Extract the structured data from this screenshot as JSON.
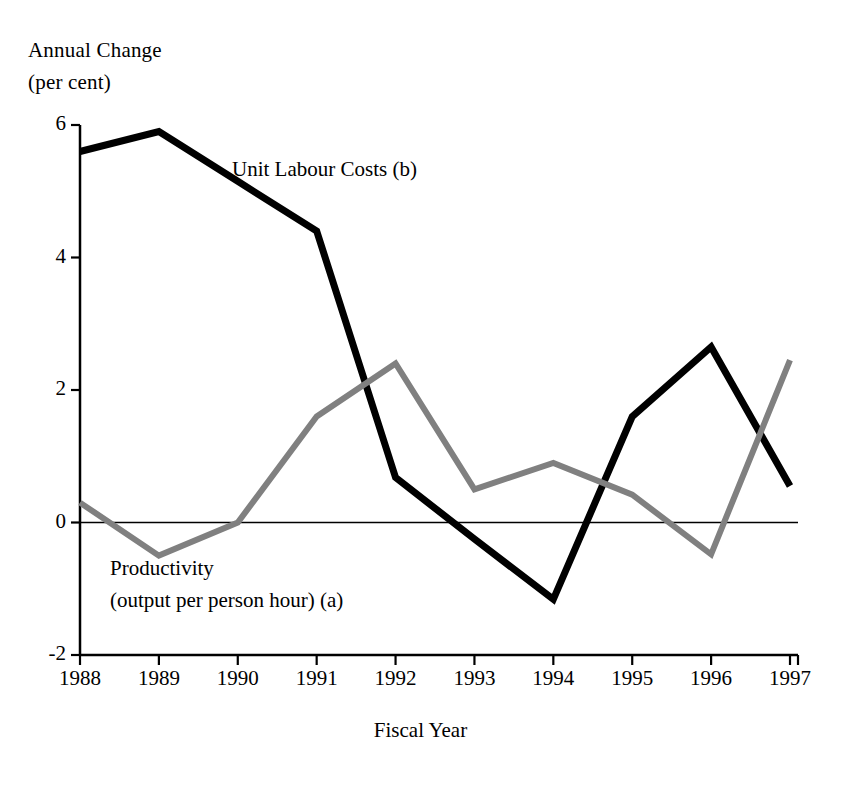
{
  "chart_data": {
    "type": "line",
    "title": "",
    "ylabel": "Annual Change",
    "ylabel_sub": "(per cent)",
    "xlabel": "Fiscal Year",
    "categories": [
      "1988",
      "1989",
      "1990",
      "1991",
      "1992",
      "1993",
      "1994",
      "1995",
      "1996",
      "1997"
    ],
    "x": [
      1988,
      1989,
      1990,
      1991,
      1992,
      1993,
      1994,
      1995,
      1996,
      1997
    ],
    "ylim": [
      -2,
      6
    ],
    "yticks": [
      "6",
      "4",
      "2",
      "0",
      "-2"
    ],
    "ytick_values": [
      6,
      4,
      2,
      0,
      -2
    ],
    "grid": false,
    "legend_position": "inline-annotation",
    "zero_line": true,
    "series": [
      {
        "name": "Unit Labour Costs (b)",
        "color": "#000000",
        "values": [
          5.6,
          5.9,
          5.15,
          4.4,
          0.68,
          -0.25,
          -1.16,
          1.6,
          2.65,
          0.55
        ]
      },
      {
        "name": "Productivity (output per person hour) (a)",
        "color": "#808080",
        "values": [
          0.3,
          -0.5,
          0.0,
          1.6,
          2.4,
          0.5,
          0.9,
          0.42,
          -0.48,
          2.45
        ]
      }
    ],
    "annotations": [
      {
        "name": "ulc-label",
        "text": "Unit Labour Costs (b)"
      },
      {
        "name": "productivity-label-line1",
        "text": "Productivity"
      },
      {
        "name": "productivity-label-line2",
        "text": "(output per person hour) (a)"
      }
    ]
  }
}
